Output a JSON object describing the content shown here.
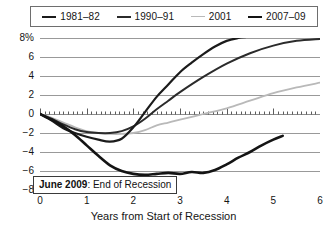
{
  "legend": {
    "position": "top",
    "entries": [
      {
        "label": "1981–82",
        "color": "#1b1b1b",
        "width": 2.2
      },
      {
        "label": "1990–91",
        "color": "#2b2b2b",
        "width": 2.0
      },
      {
        "label": "2001",
        "color": "#b9b9b9",
        "width": 1.8
      },
      {
        "label": "2007–09",
        "color": "#141414",
        "width": 2.6
      }
    ]
  },
  "annotation": {
    "bold_text": "June 2009",
    "rest_text": ": End of Recession"
  },
  "axes": {
    "ytick_labels": [
      "8%",
      "6",
      "4",
      "2",
      "0",
      "−2",
      "−4",
      "−6",
      "−8"
    ],
    "xtick_labels": [
      "0",
      "1",
      "2",
      "3",
      "4",
      "5",
      "6"
    ],
    "xlabel": "Years from Start of Recession",
    "ylabel": ""
  },
  "colors": {
    "grid": "#8d8d8d",
    "zero_axis": "#4a4a4a",
    "text": "#151515",
    "background": "#ffffff"
  },
  "chart_data": {
    "type": "line",
    "title": "",
    "subtitle": "",
    "xlabel": "Years from Start of Recession",
    "ylabel": "",
    "xlim": [
      0,
      6
    ],
    "ylim": [
      -8,
      8
    ],
    "ytick_values": [
      8,
      6,
      4,
      2,
      0,
      -2,
      -4,
      -6,
      -8
    ],
    "xtick_values": [
      0,
      1,
      2,
      3,
      4,
      5,
      6
    ],
    "grid": true,
    "legend_position": "top",
    "annotations": [
      {
        "text": "June 2009: End of Recession",
        "x": 2.0,
        "y": -6.3,
        "box": true
      }
    ],
    "series": [
      {
        "name": "1981–82",
        "color": "#1b1b1b",
        "x": [
          0,
          0.25,
          0.5,
          0.75,
          1.0,
          1.25,
          1.5,
          1.75,
          2.0,
          2.25,
          2.5,
          2.75,
          3.0,
          3.25,
          3.5,
          3.75,
          4.0,
          4.25,
          4.4
        ],
        "y": [
          0.0,
          -0.7,
          -1.5,
          -2.0,
          -2.4,
          -2.7,
          -2.9,
          -2.6,
          -1.4,
          0.2,
          1.8,
          3.1,
          4.4,
          5.4,
          6.3,
          7.1,
          7.7,
          8.0,
          8.1
        ]
      },
      {
        "name": "1990–91",
        "color": "#2b2b2b",
        "x": [
          0,
          0.25,
          0.5,
          0.75,
          1.0,
          1.25,
          1.5,
          1.75,
          2.0,
          2.25,
          2.5,
          2.75,
          3.0,
          3.5,
          4.0,
          4.5,
          5.0,
          5.5,
          6.0
        ],
        "y": [
          0.0,
          -0.5,
          -1.1,
          -1.6,
          -1.9,
          -2.0,
          -2.0,
          -1.8,
          -1.3,
          -0.5,
          0.5,
          1.4,
          2.3,
          3.9,
          5.3,
          6.4,
          7.2,
          7.7,
          7.9
        ]
      },
      {
        "name": "2001",
        "color": "#b9b9b9",
        "x": [
          0,
          0.25,
          0.5,
          0.75,
          1.0,
          1.25,
          1.5,
          1.75,
          2.0,
          2.25,
          2.5,
          2.75,
          3.0,
          3.5,
          4.0,
          4.5,
          5.0,
          5.5,
          6.0
        ],
        "y": [
          0.0,
          -0.4,
          -0.9,
          -1.4,
          -1.8,
          -2.0,
          -2.1,
          -2.1,
          -2.0,
          -1.7,
          -1.2,
          -0.9,
          -0.6,
          0.0,
          0.6,
          1.4,
          2.2,
          2.8,
          3.3
        ]
      },
      {
        "name": "2007–09",
        "color": "#141414",
        "x": [
          0,
          0.25,
          0.5,
          0.75,
          1.0,
          1.25,
          1.5,
          1.75,
          2.0,
          2.25,
          2.5,
          2.75,
          3.0,
          3.25,
          3.5,
          3.75,
          4.0,
          4.25,
          4.5,
          4.75,
          5.0,
          5.2
        ],
        "y": [
          0.0,
          -0.6,
          -1.3,
          -2.2,
          -3.3,
          -4.4,
          -5.4,
          -6.0,
          -6.3,
          -6.4,
          -6.3,
          -6.2,
          -6.3,
          -6.1,
          -6.2,
          -5.9,
          -5.3,
          -4.6,
          -4.0,
          -3.3,
          -2.7,
          -2.3
        ]
      }
    ]
  }
}
